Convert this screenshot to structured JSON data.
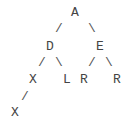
{
  "tree": {
    "root": {
      "label": "A",
      "x": 70,
      "y": 6
    },
    "nodes": [
      {
        "id": "A",
        "label": "A",
        "x": 70,
        "y": 6
      },
      {
        "id": "D",
        "label": "D",
        "x": 45,
        "y": 40
      },
      {
        "id": "E",
        "label": "E",
        "x": 95,
        "y": 40
      },
      {
        "id": "X1",
        "label": "X",
        "x": 28,
        "y": 73
      },
      {
        "id": "L",
        "label": "L",
        "x": 62,
        "y": 73
      },
      {
        "id": "R1",
        "label": "R",
        "x": 79,
        "y": 73
      },
      {
        "id": "R2",
        "label": "R",
        "x": 112,
        "y": 73
      },
      {
        "id": "X2",
        "label": "X",
        "x": 10,
        "y": 106
      }
    ],
    "edges": [
      {
        "from": "A",
        "to": "D",
        "glyph": "/",
        "x": 54,
        "y": 22
      },
      {
        "from": "A",
        "to": "E",
        "glyph": "\\",
        "x": 87,
        "y": 22
      },
      {
        "from": "D",
        "to": "X1",
        "glyph": "/",
        "x": 37,
        "y": 56
      },
      {
        "from": "D",
        "to": "L",
        "glyph": "\\",
        "x": 54,
        "y": 56
      },
      {
        "from": "E",
        "to": "R1",
        "glyph": "/",
        "x": 87,
        "y": 56
      },
      {
        "from": "E",
        "to": "R2",
        "glyph": "\\",
        "x": 104,
        "y": 56
      },
      {
        "from": "X1",
        "to": "X2",
        "glyph": "/",
        "x": 20,
        "y": 90
      }
    ]
  }
}
